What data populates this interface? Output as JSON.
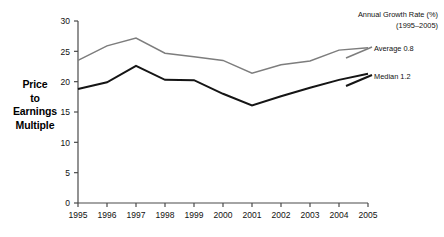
{
  "chart_data": {
    "type": "line",
    "title": "",
    "xlabel": "",
    "ylabel": "Price to Earnings Multiple",
    "categories": [
      "1995",
      "1996",
      "1997",
      "1998",
      "1999",
      "2000",
      "2001",
      "2002",
      "2003",
      "2004",
      "2005"
    ],
    "x": [
      1995,
      1996,
      1997,
      1998,
      1999,
      2000,
      2001,
      2002,
      2003,
      2004,
      2005
    ],
    "xlim": [
      1995,
      2005
    ],
    "ylim": [
      0,
      30
    ],
    "yticks": [
      0,
      5,
      10,
      15,
      20,
      25,
      30
    ],
    "ytick_labels": [
      "0",
      "5",
      "10",
      "15",
      "20",
      "25",
      "30"
    ],
    "grid": false,
    "legend_position": "right",
    "series": [
      {
        "name": "Average",
        "label": "Average 0.8",
        "growth_rate": 0.8,
        "color": "#7d7d7d",
        "values": [
          23.5,
          25.9,
          27.2,
          24.7,
          24.1,
          23.5,
          21.4,
          22.8,
          23.4,
          25.2,
          25.6
        ]
      },
      {
        "name": "Median",
        "label": "Median 1.2",
        "growth_rate": 1.2,
        "color": "#151515",
        "values": [
          18.8,
          19.9,
          22.6,
          20.3,
          20.25,
          18.0,
          16.1,
          17.6,
          19.0,
          20.3,
          21.3
        ]
      }
    ],
    "annotations": {
      "legend_title_line1": "Annual Growth Rate (%)",
      "legend_title_line2": "(1995–2005)"
    }
  },
  "y_axis_title": {
    "line1": "Price",
    "line2": "to",
    "line3": "Earnings",
    "line4": "Multiple"
  },
  "colors": {
    "average_line": "#7d7d7d",
    "median_line": "#151515",
    "axis": "#4a4a4a",
    "text": "#111111",
    "background": "#ffffff"
  }
}
